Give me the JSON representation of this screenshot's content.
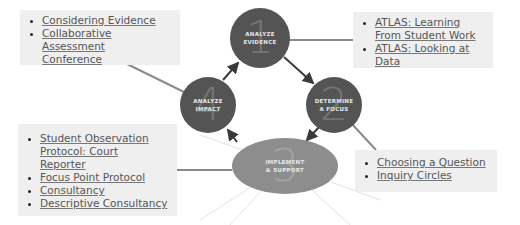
{
  "cycle": {
    "steps": [
      {
        "number": "1",
        "label": "ANALYZE\nEVIDENCE"
      },
      {
        "number": "2",
        "label": "DETERMINE\nA FOCUS"
      },
      {
        "number": "3",
        "label": "IMPLEMENT\n& SUPPORT"
      },
      {
        "number": "4",
        "label": "ANALYZE\nIMPACT"
      }
    ]
  },
  "resources": {
    "analyze_impact": [
      "Considering Evidence",
      "Collaborative Assessment Conference"
    ],
    "analyze_evidence": [
      "ATLAS: Learning From Student Work",
      "ATLAS: Looking at Data"
    ],
    "implement_support": [
      "Student Observation Protocol: Court Reporter",
      "Focus Point Protocol",
      "Consultancy",
      "Descriptive Consultancy"
    ],
    "determine_focus": [
      "Choosing a Question",
      "Inquiry Circles"
    ]
  },
  "colors": {
    "node": "#545454",
    "node_light": "#8d8d8d",
    "box_bg": "#efefef",
    "connector": "#8a8a8a",
    "arrow": "#3a3a3a"
  }
}
